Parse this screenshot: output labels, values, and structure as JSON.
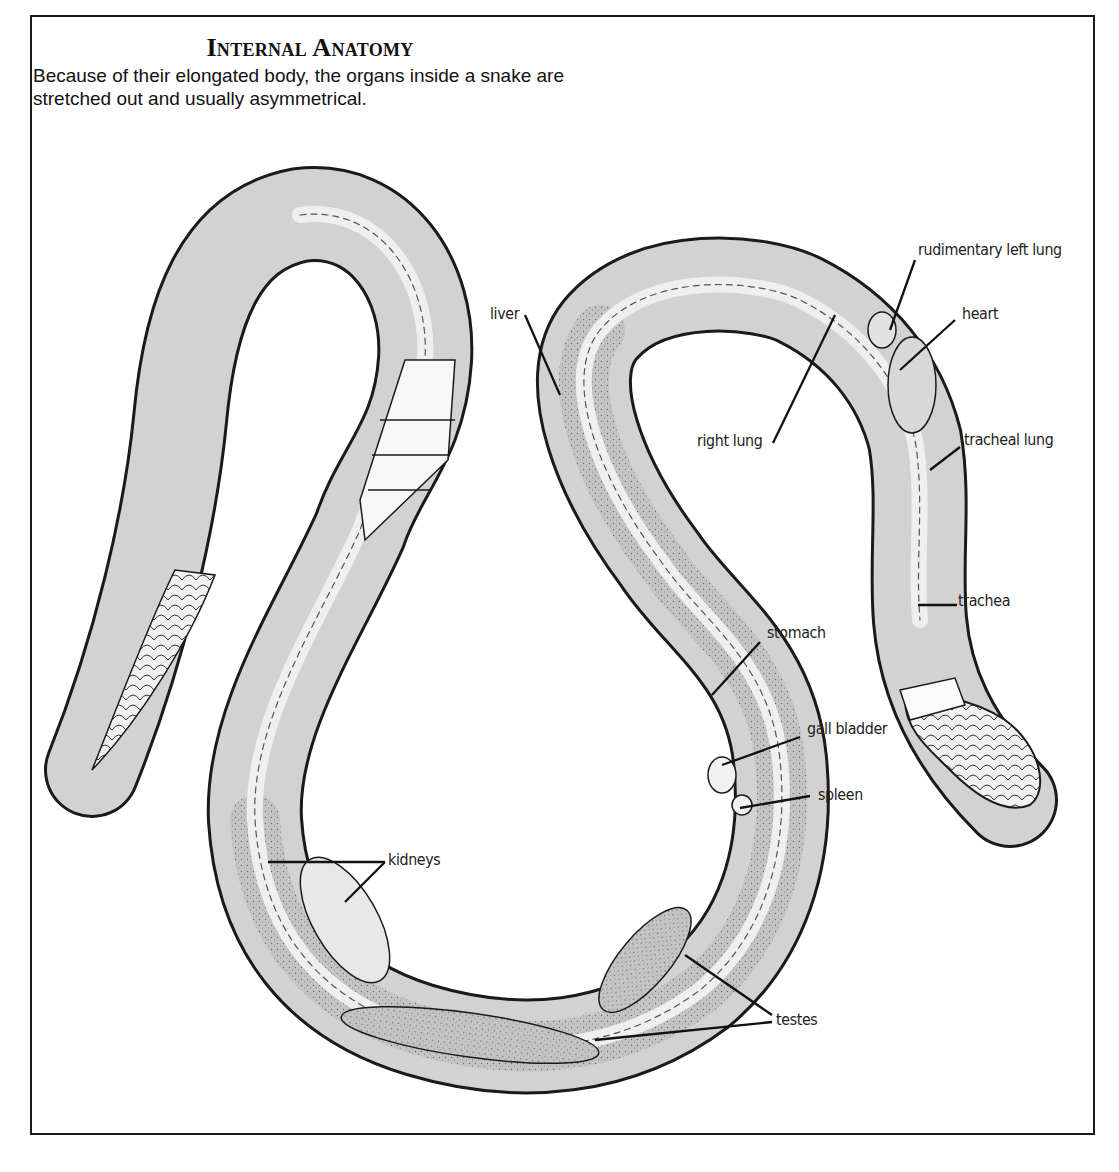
{
  "header": {
    "title": "Internal Anatomy",
    "subtitle": "Because of their elongated body, the organs inside a snake are stretched out and usually asymmetrical."
  },
  "labels": {
    "liver": "liver",
    "right_lung": "right lung",
    "rudimentary_left_lung": "rudimentary left lung",
    "heart": "heart",
    "tracheal_lung": "tracheal lung",
    "trachea": "trachea",
    "stomach": "stomach",
    "gall_bladder": "gall bladder",
    "spleen": "spleen",
    "kidneys": "kidneys",
    "testes": "testes"
  },
  "colors": {
    "ink": "#1a1a1a",
    "body_shade": "#c9c9c9",
    "body_light": "#e6e6e6",
    "background": "#ffffff"
  }
}
